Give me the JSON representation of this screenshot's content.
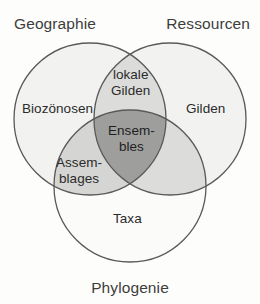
{
  "diagram": {
    "type": "venn-3-circle",
    "outer_labels": [
      {
        "id": "geographie",
        "text": "Geographie",
        "position": "top-left"
      },
      {
        "id": "ressourcen",
        "text": "Ressourcen",
        "position": "top-right"
      },
      {
        "id": "phylogenie",
        "text": "Phylogenie",
        "position": "bottom-center"
      }
    ],
    "regions": [
      {
        "id": "biozoenosen",
        "text": "Biozönosen",
        "belongs_to": [
          "geographie"
        ],
        "fill": "#f2f2f1"
      },
      {
        "id": "gilden",
        "text": "Gilden",
        "belongs_to": [
          "ressourcen"
        ],
        "fill": "#f2f2f1"
      },
      {
        "id": "taxa",
        "text": "Taxa",
        "belongs_to": [
          "phylogenie"
        ],
        "fill": "#fbfbfa"
      },
      {
        "id": "lokale-gilden",
        "line1": "lokale",
        "line2": "Gilden",
        "belongs_to": [
          "geographie",
          "ressourcen"
        ],
        "fill": "#dcdcda"
      },
      {
        "id": "assemblages",
        "line1": "Assem-",
        "line2": "blages",
        "belongs_to": [
          "geographie",
          "phylogenie"
        ],
        "fill": "#d5d5d3"
      },
      {
        "id": "resources-phylogeny-overlap",
        "text": "",
        "belongs_to": [
          "ressourcen",
          "phylogenie"
        ],
        "fill": "#dcdcda"
      },
      {
        "id": "ensembles",
        "line1": "Ensem-",
        "line2": "bles",
        "belongs_to": [
          "geographie",
          "ressourcen",
          "phylogenie"
        ],
        "fill": "#9e9e9c"
      }
    ],
    "colors": {
      "background": "#fdfdfc",
      "stroke": "#595959",
      "single_fill": "#f2f2f1",
      "pair_fill": "#dcdcda",
      "triple_fill": "#9e9e9c",
      "label_text": "#2b2b2b",
      "outer_label_text": "#3d3d3d"
    },
    "geometry": {
      "circle_radius": 76,
      "circle_geographie": {
        "cx": 90,
        "cy": 119
      },
      "circle_ressourcen": {
        "cx": 170,
        "cy": 119
      },
      "circle_phylogenie": {
        "cx": 130,
        "cy": 186
      }
    }
  }
}
